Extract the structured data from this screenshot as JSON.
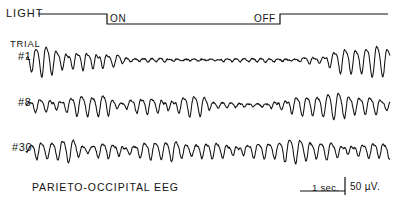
{
  "figure": {
    "caption": "PARIETO-OCCIPITAL  EEG",
    "background_color": "#ffffff",
    "trace_color": "#101010"
  },
  "light_marker": {
    "label": "LIGHT",
    "on_label": "ON",
    "off_label": "OFF",
    "baseline_y": 14,
    "active_y": 24,
    "start_x": 38,
    "on_x": 107,
    "off_x": 280,
    "end_x": 388
  },
  "trials": {
    "heading": "TRIAL",
    "items": [
      {
        "id": "#1",
        "baseline_y": 60,
        "label": "#1"
      },
      {
        "id": "#8",
        "baseline_y": 105,
        "label": "#8"
      },
      {
        "id": "#30",
        "baseline_y": 150,
        "label": "#30"
      }
    ]
  },
  "scale": {
    "time_label": "1 sec.",
    "amplitude_label": "50 µV.",
    "time_bar_x1": 300,
    "time_bar_x2": 345,
    "bar_y": 191,
    "amp_tick_x": 345,
    "amp_tick_top": 177,
    "amp_tick_bottom": 195
  },
  "chart_data": {
    "type": "line",
    "title": "PARIETO-OCCIPITAL  EEG",
    "xlabel": "",
    "ylabel": "",
    "grid": false,
    "legend": "none",
    "annotations": [
      {
        "text": "LIGHT",
        "x": 6,
        "y": 14
      },
      {
        "text": "ON",
        "x": 107,
        "y": 18
      },
      {
        "text": "OFF",
        "x": 280,
        "y": 18
      },
      {
        "text": "1 sec.",
        "x": 322,
        "y": 191
      },
      {
        "text": "50 µV.",
        "x": 350,
        "y": 191
      }
    ],
    "x_units": "seconds",
    "y_units": "microvolts",
    "amplitude_scale_uv": 50,
    "time_scale_sec": 1,
    "stimulus": {
      "on_x": 107,
      "off_x": 280
    },
    "series": [
      {
        "name": "#1",
        "baseline_y": 60,
        "segments": [
          {
            "x1": 26,
            "x2": 105,
            "amp": 13.0,
            "freq": 0.62,
            "noise": 0.9
          },
          {
            "x1": 105,
            "x2": 118,
            "amp": 6.0,
            "freq": 0.6,
            "noise": 0.8
          },
          {
            "x1": 118,
            "x2": 300,
            "amp": 1.5,
            "freq": 0.75,
            "noise": 0.9
          },
          {
            "x1": 300,
            "x2": 322,
            "amp": 6.0,
            "freq": 0.62,
            "noise": 0.8
          },
          {
            "x1": 322,
            "x2": 390,
            "amp": 12.5,
            "freq": 0.6,
            "noise": 0.9
          }
        ]
      },
      {
        "name": "#8",
        "baseline_y": 105,
        "segments": [
          {
            "x1": 26,
            "x2": 108,
            "amp": 10.0,
            "freq": 0.6,
            "noise": 1.1
          },
          {
            "x1": 108,
            "x2": 126,
            "amp": 2.0,
            "freq": 0.7,
            "noise": 0.8
          },
          {
            "x1": 126,
            "x2": 205,
            "amp": 10.5,
            "freq": 0.6,
            "noise": 1.1
          },
          {
            "x1": 205,
            "x2": 270,
            "amp": 2.0,
            "freq": 0.72,
            "noise": 0.8
          },
          {
            "x1": 270,
            "x2": 390,
            "amp": 10.5,
            "freq": 0.6,
            "noise": 1.1
          }
        ]
      },
      {
        "name": "#30",
        "baseline_y": 150,
        "segments": [
          {
            "x1": 26,
            "x2": 75,
            "amp": 9.0,
            "freq": 0.6,
            "noise": 1.1
          },
          {
            "x1": 75,
            "x2": 90,
            "amp": 3.5,
            "freq": 0.68,
            "noise": 0.9
          },
          {
            "x1": 90,
            "x2": 175,
            "amp": 9.5,
            "freq": 0.6,
            "noise": 1.1
          },
          {
            "x1": 175,
            "x2": 195,
            "amp": 5.0,
            "freq": 0.64,
            "noise": 1.0
          },
          {
            "x1": 195,
            "x2": 390,
            "amp": 9.5,
            "freq": 0.6,
            "noise": 1.1
          }
        ]
      }
    ]
  }
}
